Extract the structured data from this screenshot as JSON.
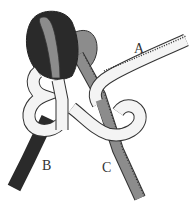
{
  "diagram": {
    "strands": [
      {
        "id": "A",
        "label": "A",
        "color": "#f4f4f4"
      },
      {
        "id": "B",
        "label": "B",
        "color": "#2a2a2a"
      },
      {
        "id": "C",
        "label": "C",
        "color": "#8a8a8a"
      }
    ],
    "colors": {
      "background": "#ffffff",
      "outline": "#333333",
      "dark_strand": "#2a2a2a",
      "gray_strand": "#8c8c8c",
      "light_strand": "#f4f4f4"
    }
  }
}
